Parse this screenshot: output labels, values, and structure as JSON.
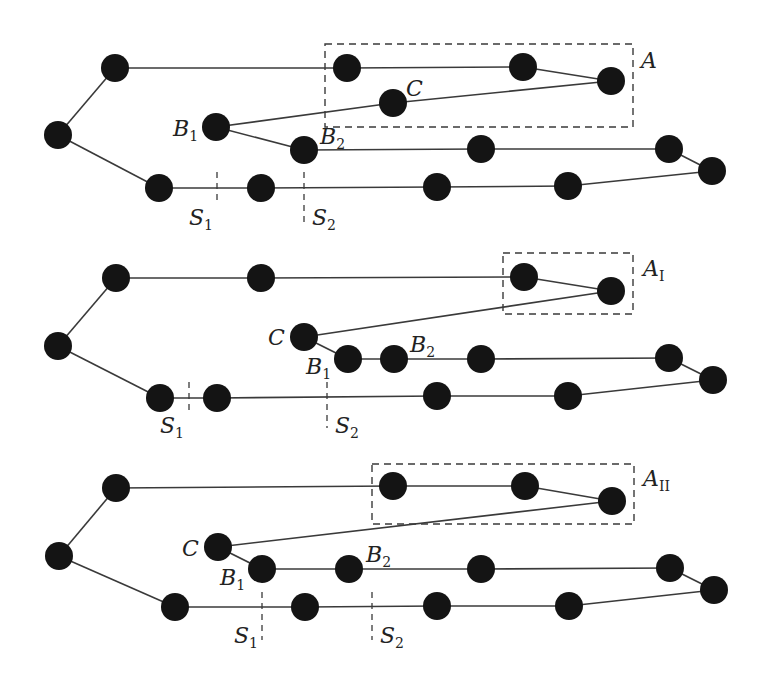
{
  "panels": [
    {
      "id": "top",
      "nodes": [
        [
          58,
          135
        ],
        [
          115,
          68
        ],
        [
          347,
          68
        ],
        [
          523,
          67
        ],
        [
          611,
          81
        ],
        [
          393,
          103
        ],
        [
          216,
          127
        ],
        [
          304,
          150
        ],
        [
          481,
          149
        ],
        [
          669,
          149
        ],
        [
          712,
          171
        ],
        [
          159,
          188
        ],
        [
          261,
          188
        ],
        [
          437,
          187
        ],
        [
          568,
          186
        ]
      ],
      "edges": [
        [
          58,
          135,
          115,
          68
        ],
        [
          115,
          68,
          347,
          68
        ],
        [
          347,
          68,
          523,
          67
        ],
        [
          523,
          67,
          611,
          81
        ],
        [
          611,
          81,
          393,
          103
        ],
        [
          393,
          103,
          216,
          127
        ],
        [
          216,
          127,
          304,
          150
        ],
        [
          304,
          150,
          481,
          149
        ],
        [
          481,
          149,
          669,
          149
        ],
        [
          669,
          149,
          712,
          171
        ],
        [
          712,
          171,
          568,
          186
        ],
        [
          568,
          186,
          437,
          187
        ],
        [
          437,
          187,
          261,
          188
        ],
        [
          261,
          188,
          159,
          188
        ],
        [
          159,
          188,
          58,
          135
        ]
      ],
      "box": {
        "x": 325,
        "y": 44,
        "w": 308,
        "h": 83
      },
      "separators": [
        {
          "x": 217,
          "y1": 172,
          "y2": 205
        },
        {
          "x": 304,
          "y1": 172,
          "y2": 222
        }
      ],
      "labels": [
        {
          "text": "B",
          "sub": "1",
          "x": 173,
          "y": 136
        },
        {
          "text": "B",
          "sub": "2",
          "x": 320,
          "y": 144
        },
        {
          "text": "C",
          "sub": "",
          "x": 406,
          "y": 96
        },
        {
          "text": "S",
          "sub": "1",
          "x": 189,
          "y": 225
        },
        {
          "text": "S",
          "sub": "2",
          "x": 312,
          "y": 225
        },
        {
          "text": "A",
          "sub": "",
          "x": 641,
          "y": 68,
          "calligraphic": true
        }
      ]
    },
    {
      "id": "middle",
      "nodes": [
        [
          58,
          346
        ],
        [
          116,
          278
        ],
        [
          261,
          278
        ],
        [
          524,
          277
        ],
        [
          611,
          291
        ],
        [
          304,
          337
        ],
        [
          348,
          359
        ],
        [
          394,
          359
        ],
        [
          481,
          359
        ],
        [
          669,
          358
        ],
        [
          713,
          380
        ],
        [
          160,
          398
        ],
        [
          217,
          398
        ],
        [
          437,
          396
        ],
        [
          568,
          396
        ]
      ],
      "edges": [
        [
          58,
          346,
          116,
          278
        ],
        [
          116,
          278,
          261,
          278
        ],
        [
          261,
          278,
          524,
          277
        ],
        [
          524,
          277,
          611,
          291
        ],
        [
          611,
          291,
          304,
          337
        ],
        [
          304,
          337,
          348,
          359
        ],
        [
          348,
          359,
          394,
          359
        ],
        [
          394,
          359,
          481,
          359
        ],
        [
          481,
          359,
          669,
          358
        ],
        [
          669,
          358,
          713,
          380
        ],
        [
          713,
          380,
          568,
          396
        ],
        [
          568,
          396,
          437,
          396
        ],
        [
          437,
          396,
          217,
          398
        ],
        [
          217,
          398,
          160,
          398
        ],
        [
          160,
          398,
          58,
          346
        ]
      ],
      "box": {
        "x": 503,
        "y": 253,
        "w": 130,
        "h": 61
      },
      "separators": [
        {
          "x": 189,
          "y1": 382,
          "y2": 410
        },
        {
          "x": 327,
          "y1": 382,
          "y2": 428
        }
      ],
      "labels": [
        {
          "text": "C",
          "sub": "",
          "x": 268,
          "y": 345
        },
        {
          "text": "B",
          "sub": "1",
          "x": 306,
          "y": 374
        },
        {
          "text": "B",
          "sub": "2",
          "x": 410,
          "y": 352
        },
        {
          "text": "S",
          "sub": "1",
          "x": 160,
          "y": 433
        },
        {
          "text": "S",
          "sub": "2",
          "x": 335,
          "y": 433
        },
        {
          "text": "A",
          "sub": "I",
          "x": 643,
          "y": 276,
          "calligraphic": true
        }
      ]
    },
    {
      "id": "bottom",
      "nodes": [
        [
          59,
          556
        ],
        [
          116,
          488
        ],
        [
          393,
          486
        ],
        [
          525,
          486
        ],
        [
          612,
          501
        ],
        [
          218,
          547
        ],
        [
          262,
          569
        ],
        [
          349,
          569
        ],
        [
          481,
          569
        ],
        [
          670,
          568
        ],
        [
          714,
          590
        ],
        [
          175,
          607
        ],
        [
          305,
          607
        ],
        [
          437,
          606
        ],
        [
          569,
          606
        ]
      ],
      "edges": [
        [
          59,
          556,
          116,
          488
        ],
        [
          116,
          488,
          393,
          486
        ],
        [
          393,
          486,
          525,
          486
        ],
        [
          525,
          486,
          612,
          501
        ],
        [
          612,
          501,
          218,
          547
        ],
        [
          218,
          547,
          262,
          569
        ],
        [
          262,
          569,
          349,
          569
        ],
        [
          349,
          569,
          481,
          569
        ],
        [
          481,
          569,
          670,
          568
        ],
        [
          670,
          568,
          714,
          590
        ],
        [
          714,
          590,
          569,
          606
        ],
        [
          569,
          606,
          437,
          606
        ],
        [
          437,
          606,
          305,
          607
        ],
        [
          305,
          607,
          175,
          607
        ],
        [
          175,
          607,
          59,
          556
        ]
      ],
      "box": {
        "x": 372,
        "y": 464,
        "w": 262,
        "h": 60
      },
      "separators": [
        {
          "x": 262,
          "y1": 592,
          "y2": 640
        },
        {
          "x": 372,
          "y1": 592,
          "y2": 640
        }
      ],
      "labels": [
        {
          "text": "C",
          "sub": "",
          "x": 182,
          "y": 556
        },
        {
          "text": "B",
          "sub": "1",
          "x": 220,
          "y": 585
        },
        {
          "text": "B",
          "sub": "2",
          "x": 366,
          "y": 562
        },
        {
          "text": "S",
          "sub": "1",
          "x": 234,
          "y": 643
        },
        {
          "text": "S",
          "sub": "2",
          "x": 380,
          "y": 643
        },
        {
          "text": "A",
          "sub": "II",
          "x": 643,
          "y": 486,
          "calligraphic": true
        }
      ]
    }
  ],
  "style": {
    "node_radius": 14,
    "node_color": "#141414",
    "edge_color": "#3a3a3a"
  }
}
